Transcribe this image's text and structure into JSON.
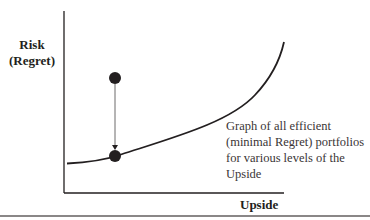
{
  "diagram": {
    "y_axis_label_line1": "Risk",
    "y_axis_label_line2": "(Regret)",
    "x_axis_label": "Upside",
    "annotation": "Graph of all efficient (minimal Regret) portfolios for various levels of the Upside",
    "points": {
      "inefficient_portfolio": {
        "x": 115,
        "y": 78
      },
      "efficient_portfolio": {
        "x": 115,
        "y": 156
      }
    },
    "colors": {
      "ink": "#231f20",
      "arrow": "#6d6a6a",
      "rule": "#8a8787"
    }
  }
}
